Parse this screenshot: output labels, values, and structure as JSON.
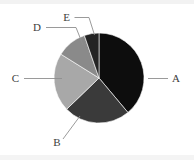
{
  "chart_data": {
    "type": "pie",
    "title": "",
    "categories": [
      "A",
      "B",
      "C",
      "D",
      "E"
    ],
    "values": [
      39,
      24,
      21,
      11,
      5
    ],
    "unit": "percent",
    "labels_position": "outside-with-leader-lines",
    "legend": "none",
    "grid": false,
    "start_angle_deg": 0,
    "direction": "clockwise",
    "slice_colors": [
      "#0d0d0d",
      "#3a3a3a",
      "#a8a8a8",
      "#8a8a8a",
      "#242424"
    ],
    "slices": [
      {
        "label": "A",
        "value": 39,
        "color": "#0d0d0d",
        "start_deg": 0,
        "end_deg": 140
      },
      {
        "label": "B",
        "value": 24,
        "color": "#3a3a3a",
        "start_deg": 140,
        "end_deg": 226
      },
      {
        "label": "C",
        "value": 21,
        "color": "#a8a8a8",
        "start_deg": 226,
        "end_deg": 302
      },
      {
        "label": "D",
        "value": 11,
        "color": "#8a8a8a",
        "start_deg": 302,
        "end_deg": 341
      },
      {
        "label": "E",
        "value": 5,
        "color": "#242424",
        "start_deg": 341,
        "end_deg": 360
      }
    ]
  },
  "figure": {
    "background_color": "#ffffff",
    "label_color": "#3d3d3d",
    "leader_line_color": "#8e8e8e",
    "center_x": 99,
    "center_y": 78,
    "radius": 45
  },
  "labels": {
    "a": "A",
    "b": "B",
    "c": "C",
    "d": "D",
    "e": "E"
  }
}
